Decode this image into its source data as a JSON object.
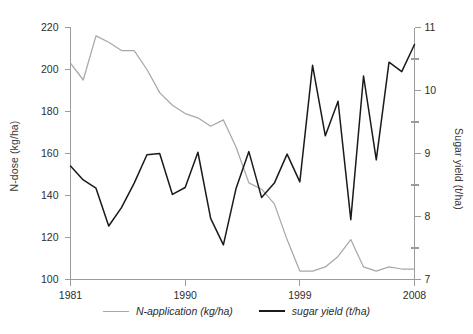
{
  "chart_data": {
    "type": "line",
    "title": "",
    "xlabel": "",
    "x": [
      1981,
      1982,
      1983,
      1984,
      1985,
      1986,
      1987,
      1988,
      1989,
      1990,
      1991,
      1992,
      1993,
      1994,
      1995,
      1996,
      1997,
      1998,
      1999,
      2000,
      2001,
      2002,
      2003,
      2004,
      2005,
      2006,
      2007,
      2008
    ],
    "xlim": [
      1981,
      2008
    ],
    "xticks": [
      1981,
      1990,
      1999,
      2008
    ],
    "xticklabels": [
      "1981",
      "1990",
      "1999",
      "2008"
    ],
    "grid": false,
    "legend_position": "bottom-center",
    "axes": [
      {
        "id": "left",
        "ylabel": "N-dose (kg/ha)",
        "ylim": [
          100,
          220
        ],
        "yticks": [
          100,
          120,
          140,
          160,
          180,
          200,
          220
        ],
        "yticklabels": [
          "100",
          "120",
          "140",
          "160",
          "180",
          "200",
          "220"
        ]
      },
      {
        "id": "right",
        "ylabel": "Sugar yield (t/ha)",
        "ylim": [
          7,
          11
        ],
        "yticks": [
          7,
          8,
          9,
          10,
          11
        ],
        "yticklabels": [
          "7",
          "8",
          "9",
          "10",
          "11"
        ],
        "minor_yticks": [
          7.5,
          8.5,
          9.5,
          10.5
        ]
      }
    ],
    "series": [
      {
        "name": "N-application (kg/ha)",
        "axis": "left",
        "color": "#a8a8a8",
        "unit": "kg/ha",
        "values": [
          203,
          195,
          216,
          213,
          209,
          209,
          200,
          189,
          183,
          179,
          177,
          173,
          176,
          163,
          146,
          143,
          136,
          119,
          104,
          104,
          106,
          111,
          119,
          106,
          104,
          106,
          105,
          105
        ]
      },
      {
        "name": "sugar yield (t/ha)",
        "axis": "right",
        "color": "#1a1a1a",
        "unit": "t/ha",
        "values": [
          8.8,
          8.58,
          8.45,
          7.85,
          8.14,
          8.53,
          8.98,
          9.0,
          8.35,
          8.46,
          9.02,
          7.97,
          7.55,
          8.45,
          9.03,
          8.3,
          8.53,
          8.99,
          8.55,
          10.4,
          9.28,
          9.83,
          7.95,
          10.23,
          8.9,
          10.45,
          10.3,
          10.73
        ]
      }
    ]
  },
  "axis_titles": {
    "left": "N-dose (kg/ha)",
    "right": "Sugar yield (t/ha)"
  },
  "legend": {
    "items": [
      {
        "label": "N-application (kg/ha)",
        "color": "#a8a8a8"
      },
      {
        "label": "sugar yield (t/ha)",
        "color": "#1a1a1a"
      }
    ]
  }
}
